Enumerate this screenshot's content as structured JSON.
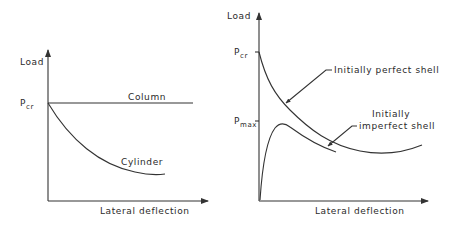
{
  "left_chart": {
    "y_axis_label": "Load",
    "x_axis_label": "Lateral deflection",
    "p_label_main": "P",
    "p_label_sub": "cr",
    "curves": [
      {
        "name": "Column",
        "label": "Column"
      },
      {
        "name": "Cylinder",
        "label": "Cylinder"
      }
    ]
  },
  "right_chart": {
    "y_axis_label": "Load",
    "x_axis_label": "Lateral deflection",
    "pcr_main": "P",
    "pcr_sub": "cr",
    "pmax_main": "P",
    "pmax_sub": "max",
    "curves": [
      {
        "name": "Initially perfect shell",
        "label": "Initially perfect shell"
      },
      {
        "name": "Initially imperfect shell",
        "label_line1": "Initially",
        "label_line2": "imperfect shell"
      }
    ]
  },
  "colors": {
    "line": "#333333",
    "text": "#2a2a2a",
    "background": "#ffffff"
  }
}
